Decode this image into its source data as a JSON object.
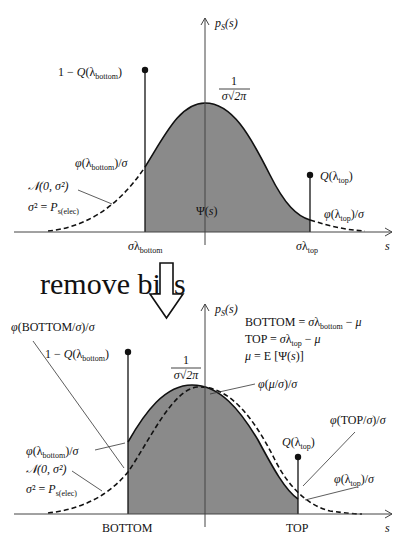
{
  "top_diagram": {
    "y_axis_label": "p_S(s)",
    "x_axis_label": "s",
    "peak_label_num": "1",
    "peak_label_den": "σ√2π",
    "stem_bottom_label": "1 − Q(λ_bottom)",
    "stem_top_label": "Q(λ_top)",
    "phi_bottom_label": "φ(λ_bottom)/σ",
    "phi_top_label": "φ(λ_top)/σ",
    "normal_label": "𝒩(0, σ²)",
    "variance_label": "σ² = P_s(elec)",
    "area_label": "Ψ(s)",
    "tick_bottom": "σλ_bottom",
    "tick_top": "σλ_top"
  },
  "transition": {
    "label": "remove bias",
    "arrow": "down-hollow-arrow"
  },
  "bottom_diagram": {
    "y_axis_label": "p_S(s)",
    "x_axis_label": "s",
    "peak_label_num": "1",
    "peak_label_den": "σ√2π",
    "definitions": [
      "BOTTOM = σλ_bottom − μ",
      "TOP = σλ_top − μ",
      "μ = E[Ψ(s)]"
    ],
    "phi_BOTTOM_label": "φ(BOTTOM/σ)/σ",
    "phi_mu_label": "φ(μ/σ)/σ",
    "phi_TOP_label": "φ(TOP/σ)/σ",
    "stem_bottom_label": "1 − Q(λ_bottom)",
    "stem_top_label": "Q(λ_top)",
    "phi_bottom_label": "φ(λ_bottom)/σ",
    "phi_top_label": "φ(λ_top)/σ",
    "normal_label": "𝒩(0, σ²)",
    "variance_label": "σ² = P_s(elec)",
    "tick_bottom": "BOTTOM",
    "tick_top": "TOP"
  },
  "colors": {
    "fill": "#8a8a8a",
    "line": "#111111",
    "axis": "#555555"
  }
}
